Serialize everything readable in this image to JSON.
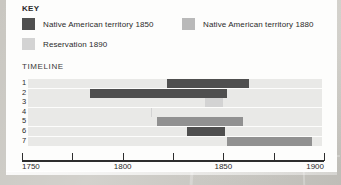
{
  "key": {
    "title": "KEY",
    "entries": [
      {
        "label": "Native American territory 1850",
        "color": "#4f4f4f"
      },
      {
        "label": "Native American territory 1880",
        "color": "#b9b9b9"
      },
      {
        "label": "Reservation 1890",
        "color": "#d3d3d3"
      }
    ]
  },
  "timeline": {
    "title": "TIMELINE"
  },
  "chart_data": {
    "type": "bar",
    "title": "TIMELINE",
    "xlabel": "",
    "ylabel": "",
    "xlim": [
      1750,
      1900
    ],
    "grid": false,
    "legend_position": "top",
    "axis_ticks": [
      1750,
      1775,
      1800,
      1825,
      1850,
      1875,
      1900
    ],
    "axis_tick_labels": [
      "1750",
      "",
      "1800",
      "",
      "1850",
      "",
      "1900"
    ],
    "categories": [
      "1",
      "2",
      "3",
      "4",
      "5",
      "6",
      "7"
    ],
    "track_range": [
      1750,
      1896
    ],
    "track_color": "#e9e9e7",
    "series": [
      {
        "name": "Native American territory 1850",
        "color": "#4f4f4f",
        "bars": [
          {
            "row": "1",
            "start": 1822,
            "end": 1863
          },
          {
            "row": "2",
            "start": 1784,
            "end": 1852
          },
          {
            "row": "6",
            "start": 1832,
            "end": 1851
          }
        ]
      },
      {
        "name": "Native American territory 1880",
        "color": "#919191",
        "bars": [
          {
            "row": "5",
            "start": 1817,
            "end": 1860
          },
          {
            "row": "7",
            "start": 1852,
            "end": 1894
          }
        ]
      },
      {
        "name": "Reservation 1890",
        "color": "#d3d3d3",
        "bars": [
          {
            "row": "3",
            "start": 1841,
            "end": 1850
          },
          {
            "row": "4",
            "start": 1814,
            "end": 1815
          }
        ]
      }
    ]
  }
}
